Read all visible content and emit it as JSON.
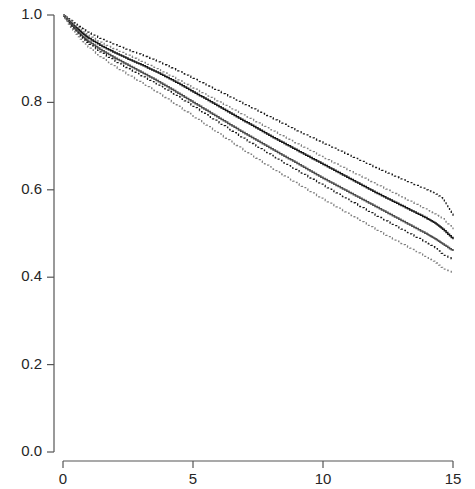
{
  "chart_data": {
    "type": "line",
    "title": "",
    "subtitle": "",
    "xlabel": "",
    "ylabel": "",
    "xlim": [
      0,
      15
    ],
    "ylim": [
      0.0,
      1.0
    ],
    "grid": false,
    "legend": "none",
    "x_ticks": [
      0,
      5,
      10,
      15
    ],
    "x_tick_labels": [
      "0",
      "5",
      "10",
      "15"
    ],
    "y_ticks": [
      0.0,
      0.2,
      0.4,
      0.6,
      0.8,
      1.0
    ],
    "y_tick_labels": [
      "0.0",
      "0.2",
      "0.4",
      "0.6",
      "0.8",
      "1.0"
    ],
    "x": [
      0,
      0.25,
      0.5,
      0.75,
      1,
      1.5,
      2,
      2.5,
      3,
      3.5,
      4,
      4.5,
      5,
      5.5,
      6,
      6.5,
      7,
      7.5,
      8,
      8.5,
      9,
      9.5,
      10,
      10.5,
      11,
      11.5,
      12,
      12.5,
      13,
      13.5,
      14,
      14.3,
      14.6,
      15
    ],
    "series": [
      {
        "name": "group-1-survival",
        "style": "solid",
        "color": "#1a1a1a",
        "values": [
          1.0,
          0.985,
          0.971,
          0.958,
          0.946,
          0.928,
          0.913,
          0.899,
          0.886,
          0.872,
          0.857,
          0.841,
          0.824,
          0.807,
          0.79,
          0.773,
          0.756,
          0.739,
          0.722,
          0.706,
          0.69,
          0.674,
          0.658,
          0.642,
          0.626,
          0.61,
          0.594,
          0.579,
          0.564,
          0.549,
          0.534,
          0.524,
          0.51,
          0.487
        ]
      },
      {
        "name": "group-2-survival",
        "style": "solid",
        "color": "#4d4d4d",
        "values": [
          1.0,
          0.982,
          0.966,
          0.951,
          0.938,
          0.918,
          0.901,
          0.885,
          0.869,
          0.853,
          0.836,
          0.818,
          0.8,
          0.782,
          0.764,
          0.746,
          0.728,
          0.711,
          0.694,
          0.677,
          0.66,
          0.643,
          0.626,
          0.61,
          0.594,
          0.578,
          0.562,
          0.546,
          0.53,
          0.514,
          0.498,
          0.488,
          0.476,
          0.46
        ]
      },
      {
        "name": "group-1-upper-ci",
        "style": "dashed",
        "color": "#1a1a1a",
        "values": [
          1.0,
          0.99,
          0.979,
          0.969,
          0.959,
          0.944,
          0.932,
          0.92,
          0.909,
          0.897,
          0.884,
          0.87,
          0.855,
          0.84,
          0.825,
          0.81,
          0.795,
          0.78,
          0.765,
          0.75,
          0.735,
          0.721,
          0.707,
          0.693,
          0.679,
          0.665,
          0.651,
          0.638,
          0.625,
          0.612,
          0.6,
          0.592,
          0.58,
          0.537
        ]
      },
      {
        "name": "group-1-lower-ci",
        "style": "dashed",
        "color": "#1a1a1a",
        "values": [
          1.0,
          0.979,
          0.962,
          0.947,
          0.933,
          0.912,
          0.894,
          0.877,
          0.861,
          0.845,
          0.828,
          0.81,
          0.791,
          0.772,
          0.753,
          0.734,
          0.715,
          0.697,
          0.679,
          0.661,
          0.644,
          0.627,
          0.61,
          0.593,
          0.576,
          0.559,
          0.542,
          0.526,
          0.51,
          0.494,
          0.478,
          0.468,
          0.452,
          0.44
        ]
      },
      {
        "name": "group-2-upper-ci",
        "style": "dashed",
        "color": "#808080",
        "values": [
          1.0,
          0.988,
          0.975,
          0.963,
          0.952,
          0.935,
          0.921,
          0.908,
          0.894,
          0.88,
          0.865,
          0.849,
          0.833,
          0.817,
          0.801,
          0.785,
          0.769,
          0.753,
          0.737,
          0.721,
          0.705,
          0.69,
          0.674,
          0.659,
          0.644,
          0.629,
          0.614,
          0.599,
          0.584,
          0.569,
          0.554,
          0.545,
          0.534,
          0.51
        ]
      },
      {
        "name": "group-2-lower-ci",
        "style": "dashed",
        "color": "#808080",
        "values": [
          1.0,
          0.975,
          0.956,
          0.939,
          0.924,
          0.901,
          0.881,
          0.863,
          0.845,
          0.827,
          0.808,
          0.788,
          0.768,
          0.748,
          0.728,
          0.708,
          0.688,
          0.669,
          0.65,
          0.632,
          0.614,
          0.596,
          0.578,
          0.561,
          0.544,
          0.527,
          0.51,
          0.493,
          0.477,
          0.461,
          0.445,
          0.435,
          0.42,
          0.41
        ]
      }
    ]
  },
  "axes": {
    "y_axis_name": "survival-probability-axis",
    "x_axis_name": "time-axis"
  }
}
